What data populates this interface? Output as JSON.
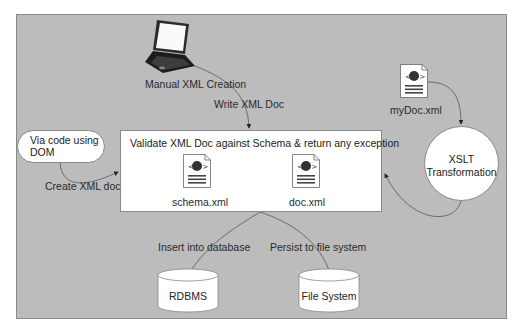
{
  "diagram": {
    "colors": {
      "panel_bg": "#bcbcbc",
      "box_bg": "#ffffff",
      "stroke": "#555555"
    },
    "nodes": {
      "laptop": {
        "label": "Manual XML Creation",
        "icon": "laptop-icon"
      },
      "via_code": {
        "label_line1": "Via code using",
        "label_line2": "DOM"
      },
      "validate": {
        "title": "Validate XML Doc against Schema & return any exception",
        "files": [
          {
            "name": "schema.xml",
            "icon": "xml-document-icon"
          },
          {
            "name": "doc.xml",
            "icon": "xml-document-icon"
          }
        ]
      },
      "mydoc": {
        "name": "myDoc.xml",
        "icon": "xml-document-icon"
      },
      "xslt": {
        "line1": "XSLT",
        "line2": "Transformation"
      },
      "rdbms": {
        "label": "RDBMS",
        "icon": "database-cylinder-icon"
      },
      "filesystem": {
        "label": "File System",
        "icon": "database-cylinder-icon"
      }
    },
    "edges": {
      "write_xml": "Write XML Doc",
      "create_xml": "Create XML doc",
      "insert_db": "Insert into database",
      "persist_fs": "Persist to file system"
    }
  }
}
